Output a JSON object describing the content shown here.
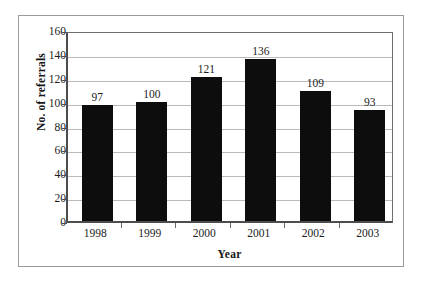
{
  "chart_data": {
    "type": "bar",
    "title": "",
    "subtitle": "",
    "xlabel": "Year",
    "ylabel": "No. of referrals",
    "categories": [
      "1998",
      "1999",
      "2000",
      "2001",
      "2002",
      "2003"
    ],
    "values": [
      97,
      100,
      121,
      136,
      109,
      93
    ],
    "data_labels": [
      "97",
      "100",
      "121",
      "136",
      "109",
      "93"
    ],
    "series": [
      {
        "name": "No. of referrals",
        "values": [
          97,
          100,
          121,
          136,
          109,
          93
        ],
        "color": "#0d0d0d"
      }
    ],
    "ylim": [
      0,
      160
    ],
    "ytick_values": [
      0,
      20,
      40,
      60,
      80,
      100,
      120,
      140,
      160
    ],
    "ytick_labels": [
      "0",
      "20",
      "40",
      "60",
      "80",
      "100",
      "120",
      "140",
      "160"
    ],
    "grid": "horizontal",
    "legend": "none",
    "bar_color": "#0d0d0d",
    "gridline_color": "#b9b9b9",
    "axis_color": "#4d4d4d",
    "background_color": "#ffffff",
    "frame_color": "#9a9a9a"
  }
}
